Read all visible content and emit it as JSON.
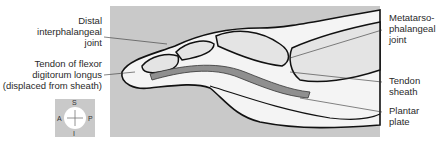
{
  "labels": {
    "distal_ip_joint": [
      "Distal",
      "interphalangeal",
      "joint"
    ],
    "tendon_fdl": [
      "Tendon of flexor",
      "digitorum longus",
      "(displaced from sheath)"
    ],
    "mtp_joint": [
      "Metatarso-",
      "phalangeal",
      "joint"
    ],
    "tendon_sheath": [
      "Tendon",
      "sheath"
    ],
    "plantar_plate": [
      "Plantar",
      "plate"
    ]
  },
  "compass": {
    "top": "S",
    "bottom": "I",
    "left": "A",
    "right": "P"
  },
  "colors": {
    "background_panel": "#c9c9c9",
    "bone_fill": "#e6e6e6",
    "tendon_fill": "#8f8f8f",
    "outline": "#111111"
  }
}
